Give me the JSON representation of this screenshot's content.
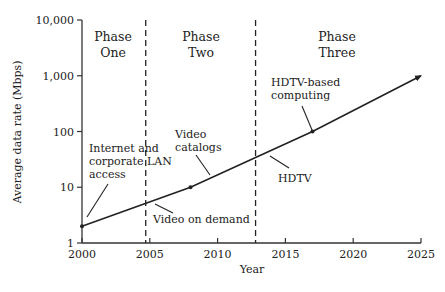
{
  "chart_data": {
    "type": "line",
    "title": "",
    "xlabel": "Year",
    "ylabel": "Average data rate (Mbps)",
    "yscale": "log",
    "xlim": [
      2000,
      2025
    ],
    "ylim": [
      1,
      10000
    ],
    "x_ticks": [
      2000,
      2005,
      2010,
      2015,
      2020,
      2025
    ],
    "x_tick_labels": [
      "2000",
      "2005",
      "2010",
      "2015",
      "2020",
      "2025"
    ],
    "y_ticks": [
      1,
      10,
      100,
      1000,
      10000
    ],
    "y_tick_labels": [
      "1",
      "10",
      "100",
      "1,000",
      "10,000"
    ],
    "grid": false,
    "legend": null,
    "series": [
      {
        "name": "Average data rate",
        "x": [
          2000,
          2008,
          2017,
          2025
        ],
        "values": [
          2,
          10,
          100,
          1000
        ],
        "marker_points": [
          2000,
          2008,
          2017
        ],
        "arrow_end": true
      }
    ],
    "phase_boundaries": [
      2004.7,
      2012.8
    ],
    "phases": [
      {
        "line1": "Phase",
        "line2": "One"
      },
      {
        "line1": "Phase",
        "line2": "Two"
      },
      {
        "line1": "Phase",
        "line2": "Three"
      }
    ],
    "annotations": [
      {
        "lines": [
          "Internet and",
          "corporate LAN",
          "access"
        ],
        "points_to": [
          2000,
          2
        ]
      },
      {
        "lines": [
          "Video on demand"
        ],
        "points_to": [
          2004.7,
          5
        ]
      },
      {
        "lines": [
          "Video",
          "catalogs"
        ],
        "points_to": [
          2008,
          10
        ]
      },
      {
        "lines": [
          "HDTV"
        ],
        "points_to": [
          2012.8,
          30
        ]
      },
      {
        "lines": [
          "HDTV-based",
          "computing"
        ],
        "points_to": [
          2017,
          100
        ]
      }
    ]
  }
}
